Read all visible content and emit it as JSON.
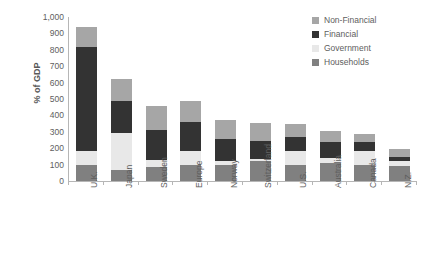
{
  "chart_data": {
    "type": "bar",
    "subtype": "stacked-column",
    "title": "",
    "xlabel": "",
    "ylabel": "% of GDP",
    "ylim": [
      0,
      1000
    ],
    "ytick_step": 100,
    "yticks": [
      "1,000",
      "900",
      "800",
      "700",
      "600",
      "500",
      "400",
      "300",
      "200",
      "100",
      "0"
    ],
    "grid": false,
    "legend_position": "top-right",
    "stack_order_bottom_to_top": [
      "Households",
      "Government",
      "Financial",
      "Non-Financial"
    ],
    "categories": [
      "U.K.",
      "Japan",
      "Sweden",
      "Europe",
      "Norway",
      "Switzerland",
      "U.S.",
      "Australia",
      "Canada",
      "N.Z."
    ],
    "series": [
      {
        "name": "Households",
        "color": "#808080",
        "values": [
          100,
          65,
          85,
          95,
          95,
          120,
          95,
          110,
          95,
          90
        ]
      },
      {
        "name": "Government",
        "color": "#e8e8e8",
        "values": [
          85,
          225,
          45,
          90,
          30,
          15,
          90,
          30,
          85,
          30
        ]
      },
      {
        "name": "Financial",
        "color": "#333333",
        "values": [
          635,
          200,
          180,
          175,
          130,
          110,
          85,
          100,
          60,
          25
        ]
      },
      {
        "name": "Non-Financial",
        "color": "#a6a6a6",
        "values": [
          120,
          135,
          150,
          130,
          115,
          110,
          75,
          65,
          45,
          50
        ]
      }
    ],
    "totals": [
      940,
      625,
      460,
      490,
      370,
      355,
      345,
      305,
      285,
      195
    ],
    "legend": [
      {
        "label": "Non-Financial",
        "color": "#a6a6a6"
      },
      {
        "label": "Financial",
        "color": "#333333"
      },
      {
        "label": "Government",
        "color": "#e8e8e8"
      },
      {
        "label": "Households",
        "color": "#808080"
      }
    ]
  },
  "axis": {
    "y_title": "% of GDP"
  }
}
